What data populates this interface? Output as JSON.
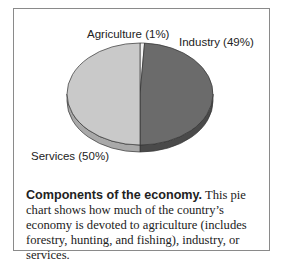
{
  "chart_data": {
    "type": "pie",
    "title": "Components of the economy.",
    "style": "3d",
    "series": [
      {
        "name": "Agriculture",
        "value": 1,
        "label": "Agriculture (1%)",
        "color": "#f4f4f4",
        "side_color": "#dcdcdc"
      },
      {
        "name": "Industry",
        "value": 49,
        "label": "Industry (49%)",
        "color": "#6b6b6b",
        "side_color": "#4a4a4a"
      },
      {
        "name": "Services",
        "value": 50,
        "label": "Services (50%)",
        "color": "#c9c9c9",
        "side_color": "#a9a9a9"
      }
    ],
    "unit": "%"
  },
  "caption": {
    "title": "Components of the economy.",
    "body": " This pie chart shows how much of the country’s economy is devoted to agriculture (includes forestry, hunt­ing, and fishing), industry, or services."
  }
}
